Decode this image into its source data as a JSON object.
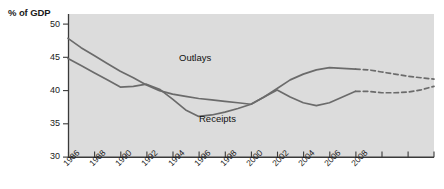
{
  "chart_data": {
    "type": "line",
    "title": "",
    "ylabel": "% of GDP",
    "xlabel": "",
    "ylim": [
      30,
      50
    ],
    "yticks": [
      30,
      35,
      40,
      45,
      50
    ],
    "xlim": [
      1986,
      2014
    ],
    "xticks": [
      1986,
      1988,
      1990,
      1992,
      1994,
      1996,
      1998,
      2000,
      2002,
      2004,
      2006,
      2008,
      2010,
      2012,
      2014
    ],
    "xtick_labels": [
      "1986",
      "1988",
      "1990",
      "1992",
      "1994",
      "1996",
      "1998",
      "2000",
      "2002",
      "2004",
      "2006",
      "2008",
      "",
      "",
      ""
    ],
    "grid": false,
    "legend_position": "inline-annotation",
    "plot_background": "#dcdcdc",
    "line_color": "#6b6b6b",
    "projection_note": "values after 2008 shown as dashed projection",
    "series": [
      {
        "name": "Outlays",
        "label_position": {
          "x": 2000,
          "y": 45.4
        },
        "x": [
          1986,
          1987,
          1988,
          1989,
          1990,
          1991,
          1992,
          1993,
          1994,
          1995,
          1996,
          1997,
          1998,
          1999,
          2000,
          2001,
          2002,
          2003,
          2004,
          2005,
          2006,
          2007,
          2008,
          2009,
          2010,
          2011,
          2012,
          2013,
          2014
        ],
        "values": [
          46.6,
          45.3,
          44.2,
          43.1,
          42.0,
          41.1,
          40.1,
          39.3,
          38.8,
          38.5,
          38.2,
          38.0,
          37.8,
          37.6,
          37.4,
          38.4,
          39.6,
          40.8,
          41.6,
          42.2,
          42.5,
          42.4,
          42.3,
          42.2,
          41.9,
          41.6,
          41.3,
          41.1,
          40.9
        ],
        "dashed_from": 2008
      },
      {
        "name": "Receipts",
        "label_position": {
          "x": 1996,
          "y": 33.2
        },
        "x": [
          1986,
          1987,
          1988,
          1989,
          1990,
          1991,
          1992,
          1993,
          1994,
          1995,
          1996,
          1997,
          1998,
          1999,
          2000,
          2001,
          2002,
          2003,
          2004,
          2005,
          2006,
          2007,
          2008,
          2009,
          2010,
          2011,
          2012,
          2013,
          2014
        ],
        "values": [
          43.8,
          42.8,
          41.8,
          40.8,
          39.8,
          39.9,
          40.2,
          39.5,
          38.1,
          36.6,
          35.7,
          35.9,
          36.3,
          36.8,
          37.4,
          38.4,
          39.4,
          38.4,
          37.6,
          37.2,
          37.6,
          38.4,
          39.2,
          39.2,
          39.0,
          39.0,
          39.1,
          39.4,
          39.9
        ],
        "dashed_from": 2008
      }
    ]
  },
  "axis": {
    "y_title": "% of GDP",
    "y_labels": [
      "50",
      "45",
      "40",
      "35",
      "30"
    ],
    "x_labels": [
      "1986",
      "1988",
      "1990",
      "1992",
      "1994",
      "1996",
      "1998",
      "2000",
      "2002",
      "2004",
      "2006",
      "2008"
    ]
  },
  "annotations": {
    "outlays_label": "Outlays",
    "receipts_label": "Receipts"
  }
}
